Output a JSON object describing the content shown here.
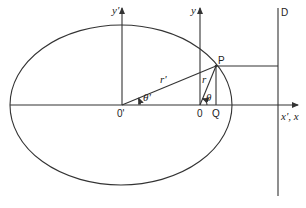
{
  "diagram": {
    "title": "",
    "type": "ellipse-focus-directrix",
    "colors": {
      "stroke": "#333333",
      "background": "#ffffff"
    },
    "labels": {
      "y_prime_axis": "y'",
      "y_axis": "y",
      "point_p": "P",
      "directrix": "D",
      "r_prime": "r'",
      "r": "r",
      "theta_prime": "θ'",
      "theta": "θ",
      "origin_prime": "0'",
      "origin": "0",
      "point_q": "Q",
      "x_axes": "x', x"
    },
    "elements": [
      "ellipse",
      "x-axis",
      "y-prime-axis",
      "y-axis",
      "radius-r-prime",
      "radius-r",
      "perpendicular-PQ",
      "horizontal-P-to-D",
      "directrix-line-D"
    ]
  }
}
